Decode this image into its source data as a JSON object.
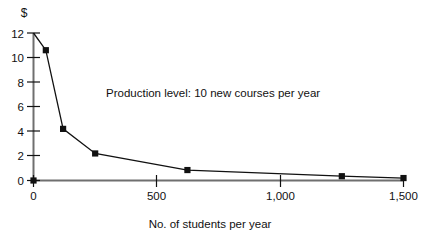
{
  "chart_data": {
    "type": "line",
    "title": "",
    "subtitle": "",
    "xlabel": "No. of students per year",
    "ylabel": "$",
    "xlim": [
      0,
      1500
    ],
    "ylim": [
      0,
      12
    ],
    "grid": false,
    "legend": "none",
    "annotations": [
      {
        "text": "Production level: 10 new courses per year",
        "x": 260,
        "y": 6.8
      }
    ],
    "xticks": [
      0,
      500,
      1000,
      1500
    ],
    "xtick_labels": [
      "0",
      "500",
      "1,000",
      "1,500"
    ],
    "yticks": [
      0,
      2,
      4,
      6,
      8,
      10,
      12
    ],
    "ytick_labels": [
      "0",
      "2",
      "4",
      "6",
      "8",
      "10",
      "12"
    ],
    "marker": "square",
    "marker_color": "#111111",
    "line_color": "#111111",
    "series": [
      {
        "name": "Cost per student",
        "x": [
          0,
          50,
          120,
          250,
          624,
          1250,
          1500
        ],
        "y": [
          12.0,
          10.6,
          4.2,
          2.2,
          0.85,
          0.35,
          0.2
        ],
        "markers_shown": [
          false,
          true,
          true,
          true,
          true,
          true,
          true
        ]
      }
    ],
    "origin_marker": {
      "x": 0,
      "y": 0,
      "shown": true
    }
  },
  "axis": {
    "y_unit_label": "$",
    "x_title": "No. of students per year"
  }
}
